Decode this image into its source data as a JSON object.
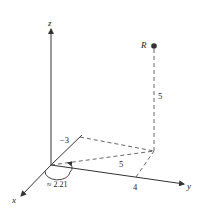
{
  "diagram": {
    "type": "3d-coordinate-axes",
    "axes": {
      "x_label": "x",
      "y_label": "y",
      "z_label": "z"
    },
    "point": {
      "label": "R"
    },
    "labels": {
      "neg_x_tick": "−3",
      "y_tick": "4",
      "height": "5",
      "radial": "5",
      "angle": "≈ 2.21"
    },
    "colors": {
      "line": "#333333",
      "dashed": "#555555",
      "point": "#333333"
    }
  }
}
